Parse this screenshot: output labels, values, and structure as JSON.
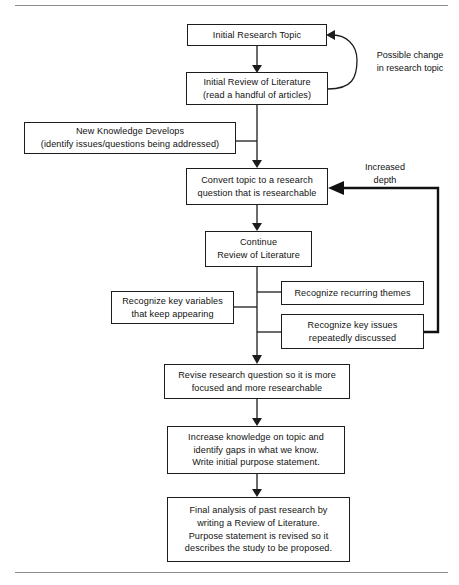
{
  "figure": {
    "type": "flowchart",
    "orientation": "top-to-bottom",
    "title_rule_top": "horizontal-rule",
    "title_rule_bottom": "horizontal-rule"
  },
  "nodes": {
    "initial_research_topic": "Initial Research Topic",
    "initial_review_of_literature": "Initial Review of Literature\n(read a handful of articles)",
    "new_knowledge_develops": "New Knowledge Develops\n(identify issues/questions being addressed)",
    "convert_topic": "Convert topic to a research\nquestion that is researchable",
    "continue_review": "Continue\nReview of Literature",
    "recognize_key_variables": "Recognize key variables\nthat keep appearing",
    "recognize_recurring_themes": "Recognize recurring themes",
    "recognize_key_issues": "Recognize key issues\nrepeatedly discussed",
    "revise_research_question": "Revise research question so it is more\nfocused and more researchable",
    "increase_knowledge": "Increase knowledge on topic and\nidentify gaps in what we know.\nWrite initial purpose statement.",
    "final_analysis": "Final analysis of past research by\nwriting a Review of Literature.\nPurpose statement is revised so it\ndescribes the study to be proposed."
  },
  "labels": {
    "possible_change": "Possible change\nin research topic",
    "increased_depth": "Increased\ndepth"
  },
  "colors": {
    "stroke": "#1c1c1c",
    "text": "#111111",
    "background": "#ffffff",
    "rule": "#8d8d90",
    "feedback_stroke": "#111111"
  },
  "edges": [
    {
      "from": "initial_research_topic",
      "to": "initial_review_of_literature",
      "kind": "straight-arrow"
    },
    {
      "from": "initial_review_of_literature",
      "to": "initial_research_topic",
      "kind": "curved-feedback-arrow",
      "label": "Possible change in research topic"
    },
    {
      "from": "new_knowledge_develops",
      "to": "main-spine",
      "kind": "connector"
    },
    {
      "from": "initial_review_of_literature",
      "to": "convert_topic",
      "kind": "straight-arrow"
    },
    {
      "from": "convert_topic",
      "to": "continue_review",
      "kind": "straight-arrow"
    },
    {
      "from": "continue_review",
      "to": "revise_research_question",
      "kind": "straight-arrow"
    },
    {
      "from": "recognize_recurring_themes",
      "to": "main-spine",
      "kind": "connector"
    },
    {
      "from": "recognize_key_variables",
      "to": "main-spine",
      "kind": "connector"
    },
    {
      "from": "recognize_key_issues",
      "to": "main-spine",
      "kind": "connector"
    },
    {
      "from": "recognize_key_issues",
      "to": "convert_topic",
      "kind": "thick-feedback-arrow",
      "label": "Increased depth"
    },
    {
      "from": "revise_research_question",
      "to": "increase_knowledge",
      "kind": "straight-arrow"
    },
    {
      "from": "increase_knowledge",
      "to": "final_analysis",
      "kind": "straight-arrow"
    }
  ]
}
